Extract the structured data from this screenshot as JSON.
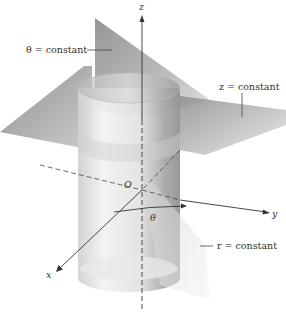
{
  "figure": {
    "axes": {
      "z": "z",
      "x": "x",
      "y": "y",
      "origin": "O",
      "angle": "θ"
    },
    "surfaces": {
      "theta_plane": {
        "label": "θ = constant"
      },
      "z_plane": {
        "label": "z = constant"
      },
      "r_cylinder": {
        "label": "r = constant"
      }
    },
    "colors": {
      "background": "#ffffff",
      "plane_dark": "#8a8a8a",
      "plane_light": "#d6d6d6",
      "cylinder_light": "#eeeeee",
      "cylinder_dark": "#9a9a9a",
      "axis": "#333333"
    }
  }
}
